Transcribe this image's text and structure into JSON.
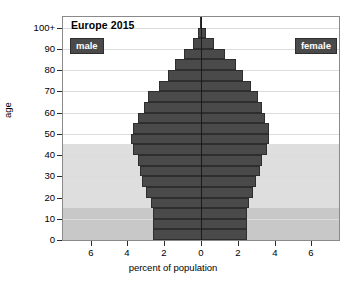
{
  "chart_data": {
    "type": "bar",
    "subtype": "population-pyramid",
    "title": "Europe 2015",
    "xlabel": "percent of population",
    "ylabel": "age",
    "xlim": [
      -7.5,
      7.5
    ],
    "ylim": [
      0,
      105
    ],
    "grid": true,
    "xtick_labels": [
      "6",
      "4",
      "2",
      "0",
      "2",
      "4",
      "6"
    ],
    "xtick_values": [
      -6,
      -4,
      -2,
      0,
      2,
      4,
      6
    ],
    "ytick_labels": [
      "0",
      "10",
      "20",
      "30",
      "40",
      "50",
      "60",
      "70",
      "80",
      "90",
      "100+"
    ],
    "ytick_values": [
      0,
      10,
      20,
      30,
      40,
      50,
      60,
      70,
      80,
      90,
      100
    ],
    "legend": [
      {
        "key": "male",
        "label": "male",
        "position": "top-left"
      },
      {
        "key": "female",
        "label": "female",
        "position": "top-right"
      }
    ],
    "categories": [
      "0-4",
      "5-9",
      "10-14",
      "15-19",
      "20-24",
      "25-29",
      "30-34",
      "35-39",
      "40-44",
      "45-49",
      "50-54",
      "55-59",
      "60-64",
      "65-69",
      "70-74",
      "75-79",
      "80-84",
      "85-89",
      "90-94",
      "95-99",
      "100+"
    ],
    "series": [
      {
        "name": "male",
        "side": "left",
        "values": [
          2.6,
          2.6,
          2.6,
          2.7,
          3.0,
          3.2,
          3.3,
          3.4,
          3.7,
          3.8,
          3.7,
          3.4,
          3.1,
          2.9,
          2.3,
          1.8,
          1.4,
          0.9,
          0.45,
          0.15,
          0.05
        ]
      },
      {
        "name": "female",
        "side": "right",
        "values": [
          2.5,
          2.5,
          2.5,
          2.6,
          2.8,
          3.0,
          3.2,
          3.3,
          3.6,
          3.7,
          3.7,
          3.5,
          3.3,
          3.1,
          2.7,
          2.3,
          1.9,
          1.3,
          0.7,
          0.25,
          0.07
        ]
      }
    ],
    "background_bands": [
      {
        "label": "young-band",
        "y_from": 0,
        "y_to": 15,
        "color": "#c8c8c8"
      },
      {
        "label": "working-band",
        "y_from": 15,
        "y_to": 45,
        "color": "#dedede"
      },
      {
        "label": "upper-band",
        "y_from": 45,
        "y_to": 105,
        "color": "#ffffff"
      }
    ],
    "colors": {
      "bar": "#4a4a4a",
      "bar_edge": "#2e2e2e",
      "axis": "#1b1b1b",
      "grid": "#dcdcdc",
      "legend_bg": "#4a4a4a",
      "legend_text": "#ffffff",
      "plot_border": "#8a8a8a",
      "page_bg": "#ffffff"
    }
  }
}
